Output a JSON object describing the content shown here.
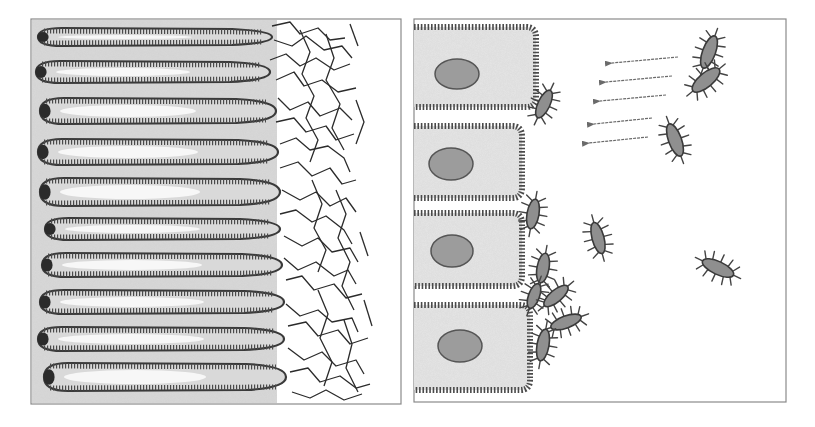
{
  "figure": {
    "width": 815,
    "height": 427,
    "colors": {
      "background": "#ffffff",
      "frame": "#8a8a8a",
      "tissue_fill": "#d9d9d9",
      "cell_fill": "#e6e6e6",
      "membrane": "#3a3a3a",
      "microvilli": "#4a4a4a",
      "villus_core": "#f7f7f7",
      "nucleus_fill": "#9c9c9c",
      "nucleus_edge": "#555555",
      "bacteria_fill": "#8f8f8f",
      "bacteria_edge": "#3a3a3a",
      "pili": "#444444",
      "mucus_fiber": "#2b2b2b",
      "arrow": "#6a6a6a"
    }
  },
  "left_panel": {
    "label": "villi-with-mucus-layer",
    "frame": {
      "x": 31,
      "y": 19,
      "w": 370,
      "h": 385
    },
    "tissue_right_edge": 276,
    "villi": [
      {
        "cy": 37,
        "x0": 38,
        "x1": 272,
        "rx_tip": 8,
        "h": 18
      },
      {
        "cy": 72,
        "x0": 36,
        "x1": 270,
        "rx_tip": 8,
        "h": 22
      },
      {
        "cy": 111,
        "x0": 40,
        "x1": 276,
        "rx_tip": 8,
        "h": 26
      },
      {
        "cy": 152,
        "x0": 38,
        "x1": 278,
        "rx_tip": 8,
        "h": 26
      },
      {
        "cy": 192,
        "x0": 40,
        "x1": 280,
        "rx_tip": 8,
        "h": 28
      },
      {
        "cy": 229,
        "x0": 45,
        "x1": 280,
        "rx_tip": 8,
        "h": 22
      },
      {
        "cy": 265,
        "x0": 42,
        "x1": 282,
        "rx_tip": 8,
        "h": 24
      },
      {
        "cy": 302,
        "x0": 40,
        "x1": 284,
        "rx_tip": 8,
        "h": 24
      },
      {
        "cy": 339,
        "x0": 38,
        "x1": 284,
        "rx_tip": 8,
        "h": 24
      },
      {
        "cy": 377,
        "x0": 44,
        "x1": 286,
        "rx_tip": 8,
        "h": 28
      }
    ],
    "mucus_fibers": [
      "M272 26 L290 22 L300 34 L318 28 L330 40 L345 38",
      "M274 40 L292 46 L306 36 L324 50 L342 46 L352 58",
      "M270 60 L286 54 L300 66 L316 58 L334 70 L350 64",
      "M276 80 L294 72 L304 86 L322 80 L338 92 L356 88",
      "M278 98 L290 110 L308 102 L320 116 L340 108 L352 120",
      "M276 122 L294 118 L306 132 L326 126 L336 140 L354 134",
      "M280 144 L296 138 L310 150 L328 146 L344 158 L350 172",
      "M280 168 L298 162 L312 176 L330 168 L342 184 L356 180",
      "M282 190 L300 200 L316 192 L330 206 L346 198 L356 212",
      "M280 214 L296 210 L312 222 L326 216 L344 230 L352 244",
      "M284 236 L302 246 L318 238 L332 252 L350 248 L358 262",
      "M284 258 L298 270 L316 262 L334 276 L348 270 L356 284",
      "M286 280 L302 276 L314 290 L334 284 L346 298 L362 294",
      "M286 304 L300 316 L318 310 L332 322 L352 318 L358 332",
      "M288 326 L306 322 L318 336 L338 330 L350 344 L368 338",
      "M288 348 L304 360 L322 352 L336 366 L356 360 L364 374",
      "M290 372 L308 368 L320 382 L340 376 L356 388 L370 384",
      "M292 392 L310 398 L326 390 L344 400 L362 394",
      "M300 30 L310 52 L302 74 L314 96 L306 118 L318 140 L310 162",
      "M326 34 L334 58 L326 80 L340 104 L332 128 L344 150",
      "M312 180 L322 204 L314 228 L326 250 L318 272",
      "M336 190 L346 214 L338 238 L350 262 L342 286 L354 310",
      "M318 290 L328 314 L320 338 L332 362 L324 386",
      "M344 320 L352 344 L346 368 L358 392",
      "M350 24 L358 46",
      "M356 100 L364 122 L356 144",
      "M360 232 L368 256",
      "M364 300 L372 326"
    ]
  },
  "right_panel": {
    "label": "epithelial-cells-with-bacteria",
    "frame": {
      "x": 414,
      "y": 19,
      "w": 372,
      "h": 383
    },
    "cells": [
      {
        "x": 414,
        "y": 27,
        "w": 122,
        "h": 80
      },
      {
        "x": 414,
        "y": 126,
        "w": 108,
        "h": 72
      },
      {
        "x": 414,
        "y": 213,
        "w": 108,
        "h": 73
      },
      {
        "x": 414,
        "y": 305,
        "w": 116,
        "h": 85
      }
    ],
    "nuclei": [
      {
        "cx": 457,
        "cy": 74,
        "rx": 22,
        "ry": 15
      },
      {
        "cx": 451,
        "cy": 164,
        "rx": 22,
        "ry": 16
      },
      {
        "cx": 452,
        "cy": 251,
        "rx": 21,
        "ry": 16
      },
      {
        "cx": 460,
        "cy": 346,
        "rx": 22,
        "ry": 16
      }
    ],
    "bacteria": [
      {
        "cx": 544,
        "cy": 104,
        "len": 30,
        "wid": 12,
        "angle": -65,
        "label": "attached"
      },
      {
        "cx": 533,
        "cy": 214,
        "len": 30,
        "wid": 12,
        "angle": -80,
        "label": "attached"
      },
      {
        "cx": 543,
        "cy": 268,
        "len": 30,
        "wid": 12,
        "angle": -80,
        "label": "attached"
      },
      {
        "cx": 534,
        "cy": 296,
        "len": 26,
        "wid": 11,
        "angle": -70,
        "label": "cluster"
      },
      {
        "cx": 556,
        "cy": 296,
        "len": 30,
        "wid": 12,
        "angle": -40,
        "label": "cluster"
      },
      {
        "cx": 566,
        "cy": 322,
        "len": 32,
        "wid": 12,
        "angle": -20,
        "label": "cluster"
      },
      {
        "cx": 543,
        "cy": 345,
        "len": 32,
        "wid": 12,
        "angle": -80,
        "label": "cluster"
      },
      {
        "cx": 709,
        "cy": 52,
        "len": 34,
        "wid": 13,
        "angle": -70,
        "label": "free"
      },
      {
        "cx": 706,
        "cy": 80,
        "len": 34,
        "wid": 14,
        "angle": -40,
        "label": "free"
      },
      {
        "cx": 675,
        "cy": 140,
        "len": 34,
        "wid": 13,
        "angle": 70,
        "label": "free"
      },
      {
        "cx": 598,
        "cy": 238,
        "len": 32,
        "wid": 12,
        "angle": 75,
        "label": "free"
      },
      {
        "cx": 718,
        "cy": 268,
        "len": 34,
        "wid": 13,
        "angle": 25,
        "label": "free"
      }
    ],
    "arrows": [
      {
        "x1": 678,
        "y1": 57,
        "x2": 612,
        "y2": 63
      },
      {
        "x1": 672,
        "y1": 76,
        "x2": 606,
        "y2": 82
      },
      {
        "x1": 666,
        "y1": 95,
        "x2": 600,
        "y2": 101
      },
      {
        "x1": 652,
        "y1": 118,
        "x2": 594,
        "y2": 124
      },
      {
        "x1": 648,
        "y1": 137,
        "x2": 589,
        "y2": 143
      }
    ]
  }
}
